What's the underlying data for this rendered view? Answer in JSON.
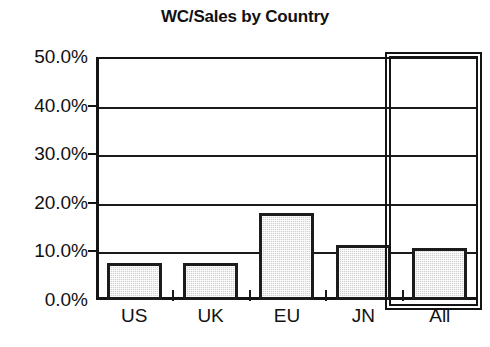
{
  "chart_data": {
    "type": "bar",
    "title": "WC/Sales by Country",
    "xlabel": "",
    "ylabel": "",
    "categories": [
      "US",
      "UK",
      "EU",
      "JN",
      "All"
    ],
    "values": [
      7.7,
      7.7,
      17.9,
      11.4,
      10.6
    ],
    "value_labels": [
      "7.7%",
      "7.7%",
      "17.9%",
      "11.4%",
      "10.6%"
    ],
    "ylim": [
      0,
      50
    ],
    "ytick_values": [
      0,
      10,
      20,
      30,
      40,
      50
    ],
    "ytick_labels": [
      "0.0%",
      "10.0%",
      "20.0%",
      "30.0%",
      "40.0%",
      "50.0%"
    ],
    "grid": true,
    "legend": false,
    "legend_position": "none",
    "series": [
      {
        "name": "WC/Sales",
        "values": [
          7.7,
          7.7,
          17.9,
          11.4,
          10.6
        ]
      }
    ],
    "annotations": [
      {
        "name": "all-category-highlight",
        "description": "rectangle outline around the All category"
      }
    ],
    "colors": {
      "bar_fill": "#cfcfcf",
      "bar_border": "#1c1c1c",
      "axis": "#141414",
      "grid": "#1a1a1a",
      "text": "#111111",
      "background": "#ffffff"
    }
  }
}
